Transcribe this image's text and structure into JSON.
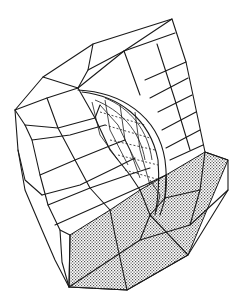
{
  "figure": {
    "type": "finite-element-mesh",
    "colors": {
      "background": "#ffffff",
      "line": "#1a1a1a",
      "shade": "#bdbdbd"
    }
  }
}
